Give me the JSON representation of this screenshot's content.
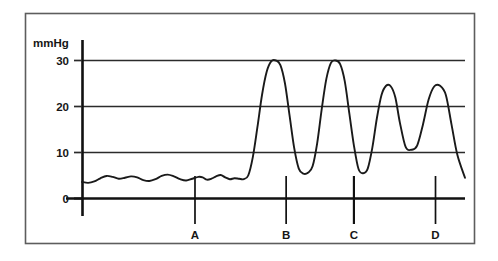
{
  "chart_data": {
    "type": "line",
    "title": "",
    "subtitle": "",
    "xlabel": "",
    "ylabel": "mmHg",
    "unit_label": "mmHg",
    "ylim": [
      0,
      33
    ],
    "yticks": [
      0,
      10,
      20,
      30
    ],
    "ytick_labels": [
      "0",
      "10",
      "20",
      "30"
    ],
    "xlim": [
      0,
      100
    ],
    "xticks": [],
    "xtick_labels": [],
    "grid": true,
    "gridlines_y": [
      10,
      20,
      30
    ],
    "legend": null,
    "legend_position": "none",
    "series": [
      {
        "name": "pressure",
        "color": "#1a1a1a",
        "x": [
          0.0,
          1.6,
          3.2,
          4.8,
          6.4,
          8.0,
          9.6,
          11.2,
          12.8,
          14.4,
          16.0,
          17.6,
          19.2,
          20.8,
          22.4,
          24.0,
          25.6,
          27.2,
          28.8,
          30.4,
          31.5,
          32.6,
          33.8,
          35.0,
          36.2,
          37.4,
          38.6,
          39.8,
          41.0,
          42.2,
          43.4,
          44.6,
          45.8,
          47.0,
          48.2,
          49.4,
          50.6,
          51.8,
          53.0,
          54.2,
          55.4,
          56.6,
          57.8,
          59.0,
          60.2,
          61.4,
          62.6,
          63.8,
          65.0,
          66.2,
          67.4,
          68.6,
          69.8,
          71.0,
          72.2,
          73.4,
          74.6,
          75.8,
          77.0,
          78.2,
          79.4,
          80.6,
          81.8,
          83.0,
          84.5,
          86.0,
          87.5,
          89.0,
          90.5,
          92.0,
          93.5,
          95.0,
          96.5,
          98.0,
          100.0
        ],
        "y": [
          3.6,
          3.4,
          3.7,
          4.4,
          4.9,
          4.7,
          4.3,
          4.5,
          4.8,
          4.6,
          4.0,
          3.8,
          4.2,
          4.9,
          5.2,
          4.8,
          4.2,
          3.9,
          4.3,
          4.7,
          4.6,
          4.1,
          4.3,
          4.8,
          5.1,
          4.6,
          4.2,
          4.4,
          4.3,
          4.2,
          5.0,
          9.0,
          15.5,
          22.5,
          27.5,
          29.8,
          30.0,
          29.0,
          25.0,
          18.0,
          11.0,
          6.5,
          5.4,
          5.6,
          7.0,
          12.0,
          19.5,
          26.0,
          29.5,
          30.0,
          29.2,
          25.5,
          18.5,
          11.5,
          6.4,
          5.5,
          6.5,
          11.0,
          17.5,
          22.5,
          24.5,
          24.4,
          22.0,
          16.5,
          11.2,
          10.6,
          11.5,
          16.0,
          21.5,
          24.4,
          24.5,
          22.5,
          16.0,
          9.5,
          4.5
        ]
      }
    ],
    "features": {
      "baseline_level": 4.2,
      "peaks": [
        30.0,
        30.0,
        24.5,
        24.5
      ],
      "troughs": [
        5.5,
        5.5,
        10.6,
        3.2
      ],
      "plateau_level": 12.6,
      "description": "Low-amplitude baseline oscillation, abrupt rise to four large pressure waves of decreasing amplitude, a deep undershoot, then a damped ripple settling at an elevated plateau."
    },
    "markers": [
      {
        "id": "A",
        "label": "A",
        "x": 29.5
      },
      {
        "id": "B",
        "label": "B",
        "x": 53.3
      },
      {
        "id": "C",
        "label": "C",
        "x": 71.0
      },
      {
        "id": "D",
        "label": "D",
        "x": 92.3
      }
    ]
  }
}
